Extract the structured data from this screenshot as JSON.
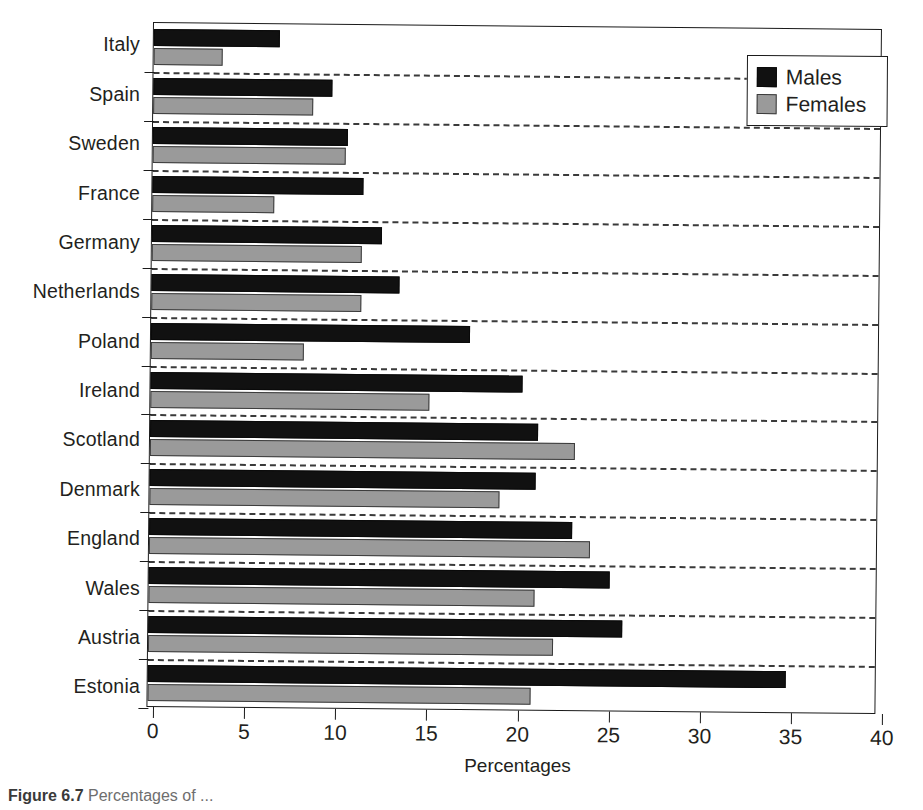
{
  "chart_data": {
    "type": "bar",
    "orientation": "horizontal",
    "title": "",
    "xlabel": "Percentages",
    "ylabel": "",
    "xlim": [
      0,
      40
    ],
    "xticks": [
      0,
      5,
      10,
      15,
      20,
      25,
      30,
      35,
      40
    ],
    "grid": "dashed horizontal separators between categories",
    "legend_position": "top-right",
    "categories": [
      "Italy",
      "Spain",
      "Sweden",
      "France",
      "Germany",
      "Netherlands",
      "Poland",
      "Ireland",
      "Scotland",
      "Denmark",
      "England",
      "Wales",
      "Austria",
      "Estonia"
    ],
    "series": [
      {
        "name": "Males",
        "color": "#111111",
        "values": [
          6.9,
          9.8,
          10.7,
          11.6,
          12.6,
          13.6,
          17.5,
          20.4,
          21.3,
          21.2,
          23.2,
          25.3,
          26.0,
          35.0
        ]
      },
      {
        "name": "Females",
        "color": "#9a9a9a",
        "values": [
          3.8,
          8.8,
          10.6,
          6.7,
          11.5,
          11.5,
          8.4,
          15.3,
          23.3,
          19.2,
          24.2,
          21.2,
          22.2,
          21.0
        ]
      }
    ]
  },
  "legend": {
    "items": [
      {
        "label": "Males",
        "swatch": "black-square"
      },
      {
        "label": "Females",
        "swatch": "gray-square"
      }
    ]
  },
  "axis": {
    "x_title": "Percentages",
    "x_tick_labels": [
      "0",
      "5",
      "10",
      "15",
      "20",
      "25",
      "30",
      "35",
      "40"
    ]
  },
  "caption": {
    "number": "Figure 6.7",
    "text": "Percentages of ..."
  }
}
